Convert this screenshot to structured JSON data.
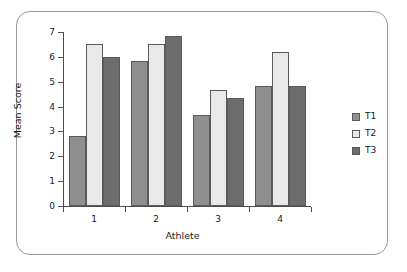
{
  "chart_data": {
    "type": "bar",
    "title": "",
    "xlabel": "Athlete",
    "ylabel": "Mean Score",
    "categories": [
      "1",
      "2",
      "3",
      "4"
    ],
    "series": [
      {
        "name": "T1",
        "color": "#8f8f8f",
        "values": [
          2.83,
          5.83,
          3.65,
          4.82
        ]
      },
      {
        "name": "T2",
        "color": "#e9e9e9",
        "values": [
          6.5,
          6.5,
          4.67,
          6.18
        ]
      },
      {
        "name": "T3",
        "color": "#6d6d6d",
        "values": [
          6.0,
          6.83,
          4.33,
          4.82
        ]
      }
    ],
    "ylim": [
      0,
      7
    ],
    "ytick_labels": [
      "0",
      "1",
      "2",
      "3",
      "4",
      "5",
      "6",
      "7"
    ],
    "ytick_values": [
      0,
      1,
      2,
      3,
      4,
      5,
      6,
      7
    ],
    "grid": false,
    "legend_position": "right",
    "legend_entries": [
      "T1",
      "T2",
      "T3"
    ],
    "axis_color": "#4d4d4d",
    "bar_outline_color": "#5a5a5a",
    "frame_color": "#9a9a9a",
    "background_color": "#ffffff"
  }
}
